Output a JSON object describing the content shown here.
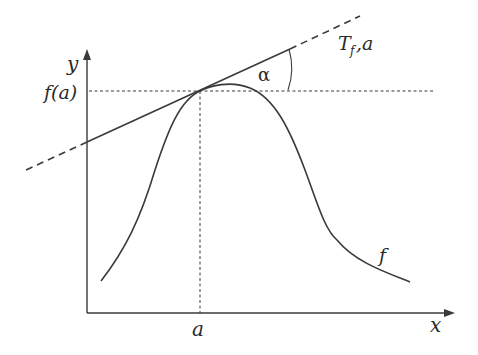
{
  "diagram": {
    "title": "",
    "labels": {
      "y_axis": "y",
      "x_axis": "x",
      "f_of_a": "f(a)",
      "a": "a",
      "angle": "α",
      "tangent_main": "T",
      "tangent_sub": "f",
      "tangent_suffix": ",a",
      "curve": "f"
    },
    "colors": {
      "line": "#3a3a3a",
      "background": "#ffffff"
    },
    "elements": [
      "y-axis with arrow",
      "x-axis with arrow",
      "bell-shaped curve f",
      "tangent line T_f,a at point (a, f(a)), solid segment with dashed extensions",
      "dotted horizontal guide at f(a)",
      "dotted vertical guide at a",
      "angle arc α between tangent and horizontal"
    ]
  }
}
